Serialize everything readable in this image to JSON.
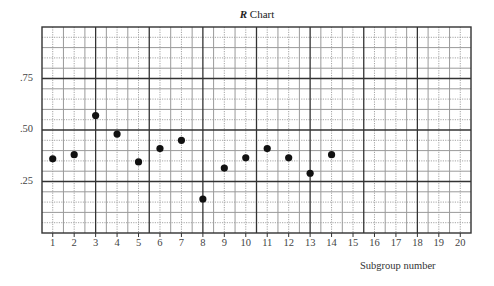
{
  "chart_data": {
    "type": "scatter",
    "title": "R Chart",
    "title_italic_part": "R",
    "title_rest": "Chart",
    "xlabel": "Subgroup number",
    "ylabel": "",
    "x_ticks": [
      1,
      2,
      3,
      4,
      5,
      6,
      7,
      8,
      9,
      10,
      11,
      12,
      13,
      14,
      15,
      16,
      17,
      18,
      19,
      20
    ],
    "y_ticks": [
      ".25",
      ".50",
      ".75"
    ],
    "y_tick_values": [
      0.25,
      0.5,
      0.75
    ],
    "xlim": [
      0,
      20
    ],
    "ylim": [
      0,
      1.0
    ],
    "grid": true,
    "legend": null,
    "x": [
      1,
      2,
      3,
      4,
      5,
      6,
      7,
      8,
      9,
      10,
      11,
      12,
      13,
      14
    ],
    "y": [
      0.36,
      0.38,
      0.57,
      0.48,
      0.345,
      0.41,
      0.45,
      0.165,
      0.315,
      0.365,
      0.41,
      0.365,
      0.29,
      0.38
    ],
    "series": [
      {
        "name": "Range",
        "points": [
          {
            "x": 1,
            "y": 0.36
          },
          {
            "x": 2,
            "y": 0.38
          },
          {
            "x": 3,
            "y": 0.57
          },
          {
            "x": 4,
            "y": 0.48
          },
          {
            "x": 5,
            "y": 0.345
          },
          {
            "x": 6,
            "y": 0.41
          },
          {
            "x": 7,
            "y": 0.45
          },
          {
            "x": 8,
            "y": 0.165
          },
          {
            "x": 9,
            "y": 0.315
          },
          {
            "x": 10,
            "y": 0.365
          },
          {
            "x": 11,
            "y": 0.41
          },
          {
            "x": 12,
            "y": 0.365
          },
          {
            "x": 13,
            "y": 0.29
          },
          {
            "x": 14,
            "y": 0.38
          }
        ]
      }
    ]
  },
  "colors": {
    "marker": "#111111",
    "major_grid": "#333333",
    "minor_grid": "#9a9a9a",
    "background": "#ffffff"
  }
}
